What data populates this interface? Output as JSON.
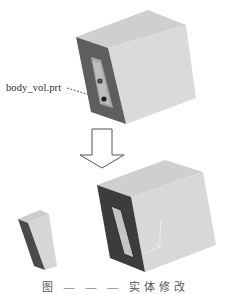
{
  "figure": {
    "callout_label": "body_vol.prt",
    "caption": "图 — — — 实体修改",
    "colors": {
      "face_light": "#d9d9d9",
      "face_top": "#cfcfcf",
      "face_dark": "#5a5a5a",
      "face_darker": "#3a3a3a",
      "arrow_stroke": "#555555",
      "background": "#ffffff"
    }
  },
  "parts": {
    "original_body": {
      "name": "body_vol.prt",
      "features": [
        "hole-1",
        "hole-2",
        "slot-pocket"
      ]
    },
    "arrow": {
      "direction": "down"
    },
    "result_left": {
      "name": "extracted-piece"
    },
    "result_right": {
      "name": "modified-body",
      "features": [
        "rectangular-window",
        "coordinate-axes"
      ]
    }
  }
}
